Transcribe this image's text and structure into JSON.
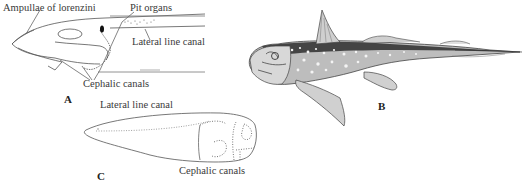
{
  "figure": {
    "panels": [
      {
        "id": "A",
        "label": "A",
        "description": "Lateral view of chimaera head showing sensory canals",
        "annotations": {
          "ampullae": "Ampullae of lorenzini",
          "pit_organs": "Pit organs",
          "lateral_line": "Lateral line canal",
          "cephalic": "Cephalic canals"
        }
      },
      {
        "id": "B",
        "label": "B",
        "description": "Spotted ratfish (chimaera) illustration"
      },
      {
        "id": "C",
        "label": "C",
        "description": "Dorsal outline of embryo showing canal system",
        "annotations": {
          "lateral_line": "Lateral line canal",
          "cephalic": "Cephalic canals"
        }
      }
    ]
  }
}
